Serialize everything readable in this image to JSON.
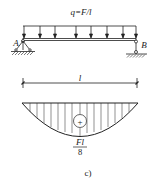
{
  "diagram": {
    "type": "simply-supported beam with uniform load and bending moment diagram",
    "load": {
      "label": "q=F/l",
      "arrow_count": 8
    },
    "supports": [
      {
        "label": "A",
        "type": "pinned"
      },
      {
        "label": "B",
        "type": "roller"
      }
    ],
    "span": {
      "label": "l"
    },
    "moment_diagram": {
      "sign": "+",
      "max_numerator": "Fl",
      "max_denominator": "8"
    },
    "caption": "c)"
  },
  "colors": {
    "line": "#222222",
    "background": "#ffffff"
  }
}
